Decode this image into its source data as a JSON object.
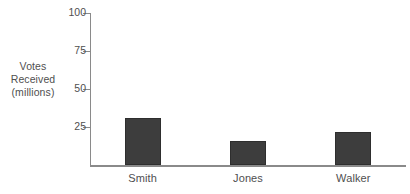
{
  "chart_data": {
    "type": "bar",
    "title": "",
    "xlabel": "",
    "ylabel": "Votes Received (millions)",
    "ylabel_lines": [
      "Votes",
      "Received",
      "(millions)"
    ],
    "categories": [
      "Smith",
      "Jones",
      "Walker"
    ],
    "values": [
      31,
      16,
      22
    ],
    "series": [
      {
        "name": "Votes Received (millions)",
        "values": [
          31,
          16,
          22
        ]
      }
    ],
    "ylim": [
      0,
      100
    ],
    "yticks": [
      25,
      50,
      75,
      100
    ],
    "ytick_labels": [
      "25",
      "50",
      "75",
      "100"
    ],
    "grid": false,
    "legend": false,
    "legend_position": "none",
    "bar_color": "#3d3d3d",
    "bar_border_color": "#2e2e2e",
    "axis_color": "#8a8a8a",
    "text_color": "#4f4f4f",
    "background_color": "#ffffff"
  }
}
